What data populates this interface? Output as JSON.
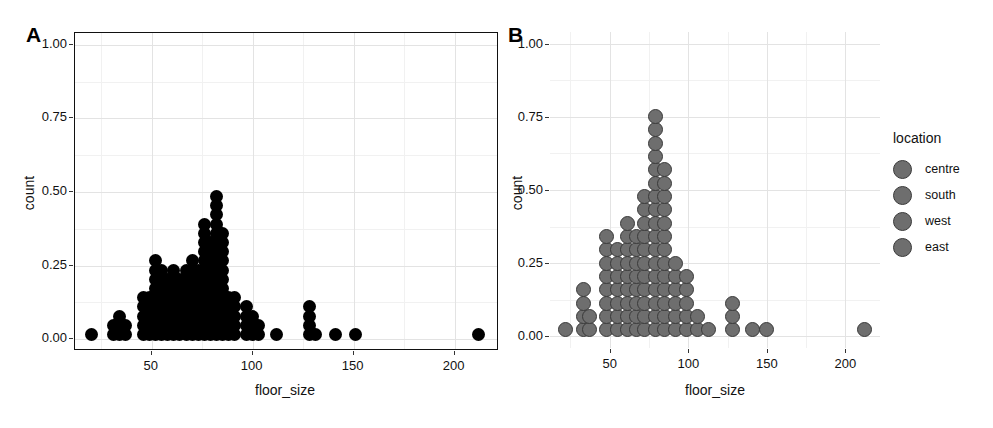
{
  "figure": {
    "panel_a_label": "A",
    "panel_b_label": "B"
  },
  "axes": {
    "x_title": "floor_size",
    "y_title": "count",
    "x_ticks": [
      "50",
      "100",
      "150",
      "200"
    ],
    "y_ticks": [
      "0.00",
      "0.25",
      "0.50",
      "0.75",
      "1.00"
    ]
  },
  "legend": {
    "title": "location",
    "items": [
      {
        "label": "centre",
        "color": "#6e6e6e"
      },
      {
        "label": "south",
        "color": "#6e6e6e"
      },
      {
        "label": "west",
        "color": "#6e6e6e"
      },
      {
        "label": "east",
        "color": "#6e6e6e"
      }
    ]
  },
  "chart_data": [
    {
      "type": "scatter",
      "panel": "A",
      "title": "A",
      "plot_kind": "dotplot",
      "xlabel": "floor_size",
      "ylabel": "count",
      "xlim": [
        12,
        222
      ],
      "ylim": [
        -0.04,
        1.04
      ],
      "x_ticks": [
        50,
        100,
        150,
        200
      ],
      "y_ticks": [
        0.0,
        0.25,
        0.5,
        0.75,
        1.0
      ],
      "grid": true,
      "legend": "none",
      "dot_color": "#000000",
      "stack_unit": 0.0313,
      "stacks": [
        {
          "x": 20,
          "count": 1
        },
        {
          "x": 31,
          "count": 2
        },
        {
          "x": 34,
          "count": 3
        },
        {
          "x": 37,
          "count": 2
        },
        {
          "x": 46,
          "count": 5
        },
        {
          "x": 49,
          "count": 5
        },
        {
          "x": 52,
          "count": 9
        },
        {
          "x": 55,
          "count": 8
        },
        {
          "x": 58,
          "count": 7
        },
        {
          "x": 61,
          "count": 8
        },
        {
          "x": 64,
          "count": 7
        },
        {
          "x": 67,
          "count": 8
        },
        {
          "x": 70,
          "count": 9
        },
        {
          "x": 73,
          "count": 8
        },
        {
          "x": 76,
          "count": 13
        },
        {
          "x": 79,
          "count": 11
        },
        {
          "x": 82,
          "count": 16
        },
        {
          "x": 85,
          "count": 12
        },
        {
          "x": 88,
          "count": 5
        },
        {
          "x": 91,
          "count": 5
        },
        {
          "x": 97,
          "count": 4
        },
        {
          "x": 100,
          "count": 3
        },
        {
          "x": 103,
          "count": 2
        },
        {
          "x": 112,
          "count": 1
        },
        {
          "x": 128,
          "count": 4
        },
        {
          "x": 131,
          "count": 1
        },
        {
          "x": 141,
          "count": 1
        },
        {
          "x": 151,
          "count": 1
        },
        {
          "x": 212,
          "count": 1
        }
      ]
    },
    {
      "type": "scatter",
      "panel": "B",
      "title": "B",
      "plot_kind": "dotplot",
      "xlabel": "floor_size",
      "ylabel": "count",
      "xlim": [
        12,
        222
      ],
      "ylim": [
        -0.04,
        1.04
      ],
      "x_ticks": [
        50,
        100,
        150,
        200
      ],
      "y_ticks": [
        0.0,
        0.25,
        0.5,
        0.75,
        1.0
      ],
      "grid": true,
      "legend": "right",
      "legend_title": "location",
      "legend_entries": [
        "centre",
        "south",
        "west",
        "east"
      ],
      "dot_color": "#6e6e6e",
      "dot_border": "#3a3a3a",
      "stack_unit": 0.0455,
      "stacks": [
        {
          "x": 22,
          "count": 1
        },
        {
          "x": 33,
          "count": 4
        },
        {
          "x": 37,
          "count": 2
        },
        {
          "x": 48,
          "count": 8
        },
        {
          "x": 55,
          "count": 7
        },
        {
          "x": 61,
          "count": 9
        },
        {
          "x": 67,
          "count": 8
        },
        {
          "x": 72,
          "count": 11
        },
        {
          "x": 79,
          "count": 17
        },
        {
          "x": 85,
          "count": 13
        },
        {
          "x": 92,
          "count": 6
        },
        {
          "x": 99,
          "count": 5
        },
        {
          "x": 106,
          "count": 2
        },
        {
          "x": 113,
          "count": 1
        },
        {
          "x": 128,
          "count": 3
        },
        {
          "x": 141,
          "count": 1
        },
        {
          "x": 150,
          "count": 1
        },
        {
          "x": 212,
          "count": 1
        }
      ]
    }
  ]
}
